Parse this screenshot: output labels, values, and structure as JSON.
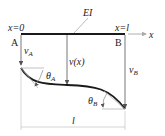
{
  "labels": {
    "x0": "x=0",
    "xl": "x=l",
    "ei": "EI",
    "x_axis": "x",
    "point_a": "A",
    "point_b": "B",
    "v_a": "v",
    "v_a_sub": "A",
    "v_x": "v(x)",
    "v_b": "v",
    "v_b_sub": "B",
    "theta_a": "θ",
    "theta_a_sub": "A",
    "theta_b": "θ",
    "theta_b_sub": "B",
    "length": "l"
  },
  "colors": {
    "beam": "#1a1a1a",
    "lines": "#444444",
    "dim": "#999999"
  }
}
